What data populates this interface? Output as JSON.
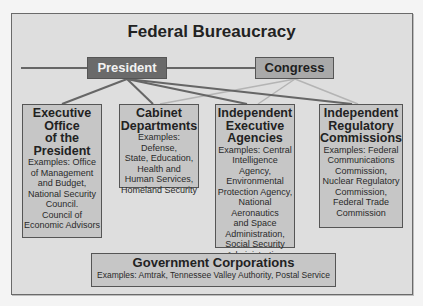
{
  "title": "Federal Bureaucracy",
  "branches": {
    "president": "President",
    "congress": "Congress"
  },
  "agencies": [
    {
      "heading": "Executive Office of the President",
      "heading_lines": [
        "Executive",
        "Office",
        "of the",
        "President"
      ],
      "examples_lines": [
        "Examples: Office",
        "of Management",
        "and Budget,",
        "National Security",
        "Council.",
        "Council of",
        "Economic Advisors"
      ],
      "connected_to": [
        "President"
      ]
    },
    {
      "heading": "Cabinet Departments",
      "heading_lines": [
        "Cabinet",
        "Departments"
      ],
      "examples_lines": [
        "Examples: Defense,",
        "State, Education,",
        "Health and",
        "Human Services,",
        "Homeland Security"
      ],
      "connected_to": [
        "President",
        "Congress"
      ]
    },
    {
      "heading": "Independent Executive Agencies",
      "heading_lines": [
        "Independent",
        "Executive",
        "Agencies"
      ],
      "examples_lines": [
        "Examples: Central",
        "Intelligence Agency,",
        "Environmental",
        "Protection Agency,",
        "National Aeronautics",
        "and Space",
        "Administration,",
        "Social Security",
        "Administration"
      ],
      "connected_to": [
        "President",
        "Congress"
      ]
    },
    {
      "heading": "Independent Regulatory Commissions",
      "heading_lines": [
        "Independent",
        "Regulatory",
        "Commissions"
      ],
      "examples_lines": [
        "Examples: Federal",
        "Communications",
        "Commission,",
        "Nuclear Regulatory",
        "Commission,",
        "Federal Trade",
        "Commission"
      ],
      "connected_to": [
        "President",
        "Congress"
      ]
    }
  ],
  "government_corporations": {
    "heading": "Government Corporations",
    "examples": "Examples: Amtrak, Tennessee Valley Authority, Postal Service"
  },
  "colors": {
    "president_fill": "#6a6a6a",
    "congress_fill": "#a9a9a9",
    "box_fill": "#c6c6c6",
    "president_line": "#666666",
    "congress_line": "#b4b4b4"
  }
}
